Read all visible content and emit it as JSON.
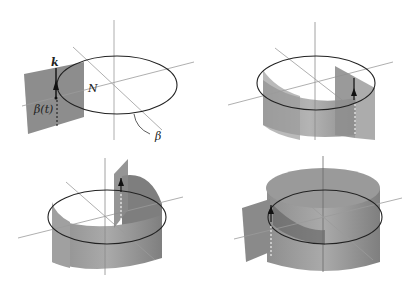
{
  "figure": {
    "panels": [
      {
        "id": "top-left",
        "labels": {
          "k": "k",
          "N": "N",
          "beta_t": "β(t)",
          "beta": "β"
        }
      },
      {
        "id": "top-right"
      },
      {
        "id": "bottom-left"
      },
      {
        "id": "bottom-right"
      }
    ]
  },
  "colors": {
    "surface": "#8a8a8a",
    "surface_dark": "#6f6f6f",
    "axis": "#999999",
    "curve": "#222222",
    "background": "#ffffff"
  }
}
